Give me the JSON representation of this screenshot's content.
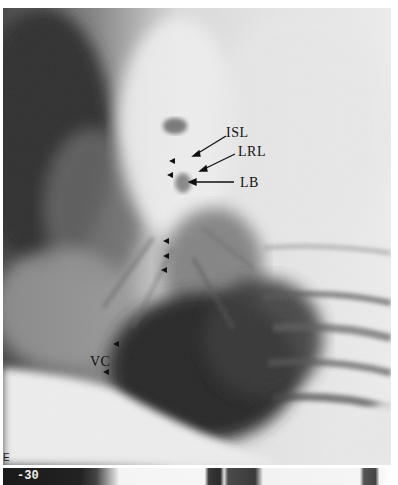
{
  "figure": {
    "panel_letter": "E",
    "strip_number": "-30",
    "labels": {
      "isl": "ISL",
      "lrl": "LRL",
      "lb": "LB",
      "vc": "VC"
    },
    "colors": {
      "ink": "#111111",
      "paper": "#ffffff",
      "dark_lung": "#3a3a3a",
      "mediastinum": "#e6e6e6"
    }
  }
}
